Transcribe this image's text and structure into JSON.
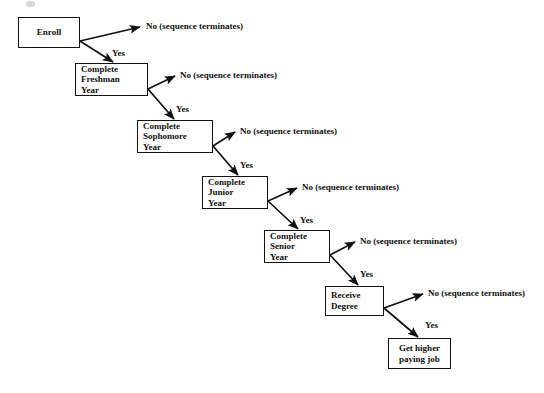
{
  "diagram": {
    "type": "flowchart",
    "background_color": "#ffffff",
    "line_color": "#111111",
    "nodes": [
      {
        "id": "enroll",
        "lines": [
          "Enroll"
        ],
        "x": 18,
        "y": 17,
        "w": 62,
        "h": 31,
        "align": "center"
      },
      {
        "id": "freshman",
        "lines": [
          "Complete",
          "Freshman",
          "Year"
        ],
        "x": 75,
        "y": 63,
        "w": 73,
        "h": 33,
        "align": "left"
      },
      {
        "id": "sophomore",
        "lines": [
          "Complete",
          "Sophomore",
          "Year"
        ],
        "x": 137,
        "y": 120,
        "w": 76,
        "h": 33,
        "align": "left"
      },
      {
        "id": "junior",
        "lines": [
          "Complete",
          "Junior",
          "Year"
        ],
        "x": 202,
        "y": 176,
        "w": 66,
        "h": 33,
        "align": "left"
      },
      {
        "id": "senior",
        "lines": [
          "Complete",
          "Senior",
          "Year"
        ],
        "x": 264,
        "y": 230,
        "w": 66,
        "h": 33,
        "align": "left"
      },
      {
        "id": "degree",
        "lines": [
          "Receive",
          "Degree"
        ],
        "x": 325,
        "y": 286,
        "w": 59,
        "h": 30,
        "align": "left"
      },
      {
        "id": "job",
        "lines": [
          "Get higher",
          "paying job"
        ],
        "x": 388,
        "y": 338,
        "w": 63,
        "h": 31,
        "align": "center"
      }
    ],
    "edges": [
      {
        "id": "enroll-no",
        "from": "enroll",
        "label": "No (sequence terminates)",
        "label_x": 146,
        "label_y": 21,
        "x1": 80,
        "y1": 41,
        "x2": 140,
        "y2": 27
      },
      {
        "id": "enroll-yes",
        "from": "enroll",
        "label": "Yes",
        "label_x": 112,
        "label_y": 48,
        "x1": 80,
        "y1": 41,
        "x2": 113,
        "y2": 62
      },
      {
        "id": "freshman-no",
        "from": "freshman",
        "label": "No (sequence terminates)",
        "label_x": 180,
        "label_y": 70,
        "x1": 148,
        "y1": 89,
        "x2": 175,
        "y2": 76
      },
      {
        "id": "freshman-yes",
        "from": "freshman",
        "label": "Yes",
        "label_x": 176,
        "label_y": 104,
        "x1": 148,
        "y1": 89,
        "x2": 174,
        "y2": 119
      },
      {
        "id": "sophomore-no",
        "from": "sophomore",
        "label": "No (sequence terminates)",
        "label_x": 240,
        "label_y": 126,
        "x1": 213,
        "y1": 146,
        "x2": 235,
        "y2": 132
      },
      {
        "id": "sophomore-yes",
        "from": "sophomore",
        "label": "Yes",
        "label_x": 240,
        "label_y": 160,
        "x1": 213,
        "y1": 146,
        "x2": 238,
        "y2": 175
      },
      {
        "id": "junior-no",
        "from": "junior",
        "label": "No (sequence terminates)",
        "label_x": 302,
        "label_y": 182,
        "x1": 268,
        "y1": 201,
        "x2": 297,
        "y2": 188
      },
      {
        "id": "junior-yes",
        "from": "junior",
        "label": "Yes",
        "label_x": 300,
        "label_y": 215,
        "x1": 268,
        "y1": 201,
        "x2": 298,
        "y2": 229
      },
      {
        "id": "senior-no",
        "from": "senior",
        "label": "No (sequence terminates)",
        "label_x": 360,
        "label_y": 236,
        "x1": 330,
        "y1": 255,
        "x2": 355,
        "y2": 242
      },
      {
        "id": "senior-yes",
        "from": "senior",
        "label": "Yes",
        "label_x": 360,
        "label_y": 269,
        "x1": 330,
        "y1": 255,
        "x2": 358,
        "y2": 285
      },
      {
        "id": "degree-no",
        "from": "degree",
        "label": "No (sequence terminates)",
        "label_x": 428,
        "label_y": 288,
        "x1": 384,
        "y1": 308,
        "x2": 423,
        "y2": 294
      },
      {
        "id": "degree-yes",
        "from": "degree",
        "label": "Yes",
        "label_x": 425,
        "label_y": 320,
        "x1": 384,
        "y1": 308,
        "x2": 418,
        "y2": 337
      }
    ]
  }
}
